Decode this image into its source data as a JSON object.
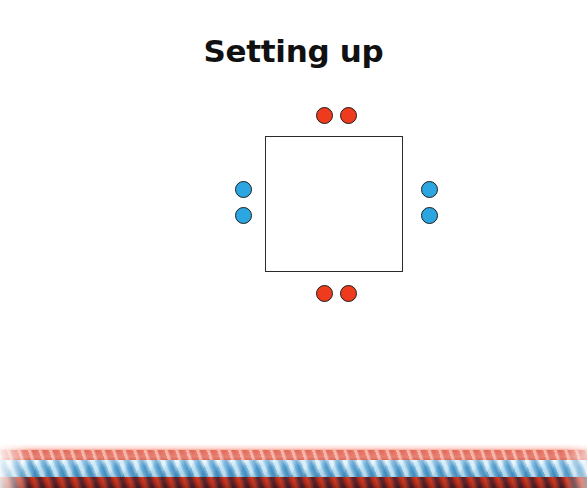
{
  "page": {
    "title": "Setting up",
    "background_color": "#ffffff"
  },
  "colors": {
    "red": "#ef3b1d",
    "blue": "#2ca6e0",
    "outline": "#1d1d1d",
    "square_border": "#2b2b2b",
    "text": "#111111"
  },
  "diagram": {
    "name": "braid-setup-diagram",
    "shape": "square",
    "dot_groups": [
      {
        "side": "top",
        "color_name": "red",
        "color": "#ef3b1d",
        "count": 2
      },
      {
        "side": "bottom",
        "color_name": "red",
        "color": "#ef3b1d",
        "count": 2
      },
      {
        "side": "left",
        "color_name": "blue",
        "color": "#2ca6e0",
        "count": 2
      },
      {
        "side": "right",
        "color_name": "blue",
        "color": "#2ca6e0",
        "count": 2
      }
    ]
  },
  "legend": {
    "label": "Braid",
    "rows": [
      {
        "swatch_icon": "red-circle-icon",
        "swatch_color": "#ef3b1d",
        "count": "4"
      },
      {
        "swatch_icon": "blue-circle-icon",
        "swatch_color": "#2ca6e0",
        "count": "4"
      }
    ]
  },
  "photo": {
    "name": "braided-rope-photo",
    "description": "Close-up photograph of a finished red and light-blue braided cord running horizontally across the bottom of the page.",
    "strand_colors": [
      "#ef3b1d",
      "#7ec4e8"
    ]
  }
}
